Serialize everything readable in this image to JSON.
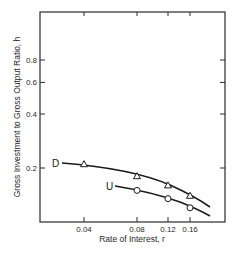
{
  "chart_data": {
    "type": "line",
    "title": "",
    "xlabel": "Rate of Interest, r",
    "ylabel": "Gross Investment to Gross Output Ratio, h",
    "xscale": "log",
    "yscale": "log",
    "x_ticks": [
      0.04,
      0.08,
      0.12,
      0.16
    ],
    "x_tick_labels": [
      "0.04",
      "0.08",
      "0.12",
      "0.16"
    ],
    "y_ticks": [
      0.2,
      0.4,
      0.6,
      0.8
    ],
    "y_tick_labels": [
      "0.2",
      "0.4",
      "0.6",
      "0.8"
    ],
    "xlim": [
      0.02,
      0.28
    ],
    "ylim": [
      0.1,
      1.6
    ],
    "grid": false,
    "legend": "inline labels at curve start",
    "series": [
      {
        "name": "D",
        "marker": "triangle",
        "points": [
          {
            "x": 0.04,
            "y": 0.21
          },
          {
            "x": 0.08,
            "y": 0.18
          },
          {
            "x": 0.12,
            "y": 0.16
          },
          {
            "x": 0.16,
            "y": 0.14
          }
        ],
        "curve_range": {
          "x_start": 0.03,
          "x_end": 0.21
        }
      },
      {
        "name": "U",
        "marker": "circle",
        "points": [
          {
            "x": 0.08,
            "y": 0.15
          },
          {
            "x": 0.12,
            "y": 0.135
          },
          {
            "x": 0.16,
            "y": 0.12
          }
        ],
        "curve_range": {
          "x_start": 0.06,
          "x_end": 0.21
        }
      }
    ]
  },
  "labels": {
    "series_D": "D",
    "series_U": "U"
  }
}
